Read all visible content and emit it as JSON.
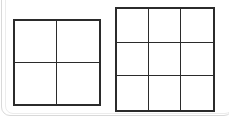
{
  "canvas": {
    "width": 229,
    "height": 120,
    "background_color": "#ffffff"
  },
  "card": {
    "border_color": "#d9d9d9",
    "inner_border_color": "#ececec",
    "corner_radius": 9
  },
  "figures": [
    {
      "id": "figure-2x2",
      "name": "2x2-grid",
      "rows": 2,
      "columns": 3,
      "cell_count": 4,
      "line_color": "#2b2b2b",
      "outer_stroke_width": 2,
      "inner_stroke_width": 1,
      "fill_color": "#ffffff",
      "x": 13,
      "y": 19,
      "width": 88,
      "height": 87,
      "cells": [
        {
          "row": 1,
          "col": 1,
          "label": ""
        },
        {
          "row": 1,
          "col": 2,
          "label": ""
        },
        {
          "row": 2,
          "col": 1,
          "label": ""
        },
        {
          "row": 2,
          "col": 2,
          "label": ""
        }
      ]
    },
    {
      "id": "figure-3x3",
      "name": "3x3-grid",
      "rows": 3,
      "columns": 3,
      "cell_count": 9,
      "line_color": "#2b2b2b",
      "outer_stroke_width": 2,
      "inner_stroke_width": 1,
      "fill_color": "#ffffff",
      "x": 115,
      "y": 7,
      "width": 100,
      "height": 105,
      "cells": [
        {
          "row": 1,
          "col": 1,
          "label": ""
        },
        {
          "row": 1,
          "col": 2,
          "label": ""
        },
        {
          "row": 1,
          "col": 3,
          "label": ""
        },
        {
          "row": 2,
          "col": 1,
          "label": ""
        },
        {
          "row": 2,
          "col": 2,
          "label": ""
        },
        {
          "row": 2,
          "col": 3,
          "label": ""
        },
        {
          "row": 3,
          "col": 1,
          "label": ""
        },
        {
          "row": 3,
          "col": 2,
          "label": ""
        },
        {
          "row": 3,
          "col": 3,
          "label": ""
        }
      ]
    }
  ]
}
